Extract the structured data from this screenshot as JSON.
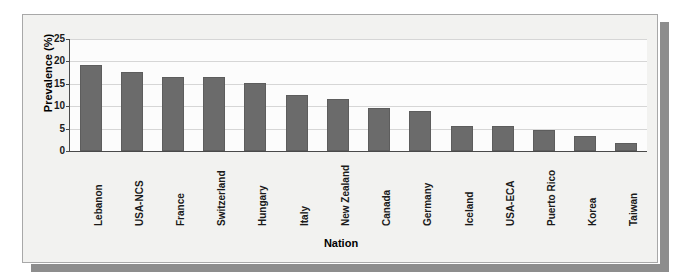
{
  "chart_data": {
    "type": "bar",
    "title": "",
    "xlabel": "Nation",
    "ylabel": "Prevalence (%)",
    "ylim": [
      0,
      25
    ],
    "yticks": [
      0,
      5,
      10,
      15,
      20,
      25
    ],
    "grid": true,
    "legend": "none",
    "bar_color": "#6b6b6b",
    "categories": [
      "Lebanon",
      "USA-NCS",
      "France",
      "Switzerland",
      "Hungary",
      "Italy",
      "New Zealand",
      "Canada",
      "Germany",
      "Iceland",
      "USA-ECA",
      "Puerto Rico",
      "Korea",
      "Taiwan"
    ],
    "values": [
      19.1,
      17.7,
      16.5,
      16.5,
      15.1,
      12.6,
      11.6,
      9.6,
      9.0,
      5.5,
      5.5,
      4.8,
      3.3,
      1.7
    ]
  }
}
